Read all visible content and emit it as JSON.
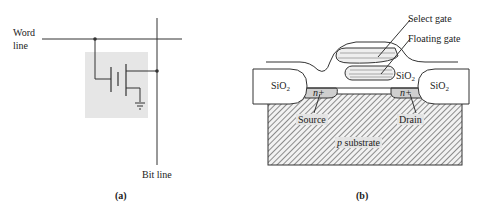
{
  "panel_a": {
    "word_line_label_1": "Word",
    "word_line_label_2": "line",
    "bit_line_label": "Bit line",
    "caption": "(a)",
    "cell_background": "#e6e6e6"
  },
  "panel_b": {
    "select_gate_label": "Select gate",
    "floating_gate_label": "Floating gate",
    "sio2_left": "SiO",
    "sio2_mid": "SiO",
    "sio2_right": "SiO",
    "sio2_subscript": "2",
    "n_plus_left": "n+",
    "n_plus_right": "n+",
    "source_label": "Source",
    "drain_label": "Drain",
    "substrate_p": "p",
    "substrate_label": " substrate",
    "caption": "(b)"
  }
}
